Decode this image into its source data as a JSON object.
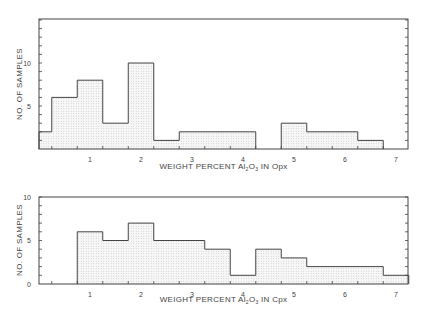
{
  "header_text": "Petrology of ... and ...",
  "chart_data": [
    {
      "type": "bar",
      "title": "",
      "xlabel": "WEIGHT PERCENT Al2O3 IN Opx",
      "xlabel_parts": {
        "prefix": "WEIGHT PERCENT  Al",
        "sub1": "2",
        "mid": "O",
        "sub2": "3",
        "suffix": " IN Opx"
      },
      "ylabel": "NO. OF SAMPLES",
      "xlim": [
        0,
        7.25
      ],
      "ylim": [
        0,
        15
      ],
      "x_ticks": [
        "1",
        "2",
        "3",
        "4",
        "5",
        "6",
        "7"
      ],
      "y_ticks": [
        "5",
        "10"
      ],
      "grid": false,
      "bins": [
        {
          "from": 0.0,
          "to": 0.25,
          "count": 2
        },
        {
          "from": 0.25,
          "to": 0.75,
          "count": 6
        },
        {
          "from": 0.75,
          "to": 1.25,
          "count": 8
        },
        {
          "from": 1.25,
          "to": 1.75,
          "count": 3
        },
        {
          "from": 1.75,
          "to": 2.25,
          "count": 10
        },
        {
          "from": 2.25,
          "to": 2.75,
          "count": 1
        },
        {
          "from": 2.75,
          "to": 4.25,
          "count": 2
        },
        {
          "from": 4.25,
          "to": 4.75,
          "count": 0
        },
        {
          "from": 4.75,
          "to": 5.25,
          "count": 3
        },
        {
          "from": 5.25,
          "to": 6.25,
          "count": 2
        },
        {
          "from": 6.25,
          "to": 6.75,
          "count": 1
        }
      ]
    },
    {
      "type": "bar",
      "title": "",
      "xlabel": "WEIGHT PERCENT Al2O3 IN Cpx",
      "xlabel_parts": {
        "prefix": "WEIGHT PERCENT  Al",
        "sub1": "2",
        "mid": "O",
        "sub2": "3",
        "suffix": " IN Cpx"
      },
      "ylabel": "NO. OF SAMPLES",
      "xlim": [
        0,
        7.25
      ],
      "ylim": [
        0,
        10
      ],
      "x_ticks": [
        "1",
        "2",
        "3",
        "4",
        "5",
        "6",
        "7"
      ],
      "y_ticks": [
        "0",
        "5",
        "10"
      ],
      "grid": false,
      "bins": [
        {
          "from": 0.75,
          "to": 1.25,
          "count": 6
        },
        {
          "from": 1.25,
          "to": 1.75,
          "count": 5
        },
        {
          "from": 1.75,
          "to": 2.25,
          "count": 7
        },
        {
          "from": 2.25,
          "to": 3.25,
          "count": 5
        },
        {
          "from": 3.25,
          "to": 3.75,
          "count": 4
        },
        {
          "from": 3.75,
          "to": 4.25,
          "count": 1
        },
        {
          "from": 4.25,
          "to": 4.75,
          "count": 4
        },
        {
          "from": 4.75,
          "to": 5.25,
          "count": 3
        },
        {
          "from": 5.25,
          "to": 6.75,
          "count": 2
        },
        {
          "from": 6.75,
          "to": 7.25,
          "count": 1
        }
      ]
    }
  ],
  "colors": {
    "line": "#444444",
    "fill": "#f2f2f2",
    "dot": "#bbbbbb"
  }
}
